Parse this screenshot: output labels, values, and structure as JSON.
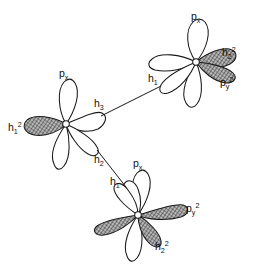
{
  "figure": {
    "background_color": "#ffffff",
    "line_color": "#1a1a1a",
    "shaded_lobe_fill": "#8c8c8c"
  },
  "atoms": [
    {
      "id": "atom-top-right",
      "name": "top-right-atom",
      "center": {
        "x": 196,
        "y": 62
      },
      "labels": [
        {
          "key": "px",
          "base": "p",
          "sub": "x",
          "sup": "",
          "text": "px",
          "x": 194,
          "y": 16
        },
        {
          "key": "h2sq",
          "base": "h",
          "sub": "2",
          "sup": "2",
          "text": "h2 2",
          "x": 224,
          "y": 53
        },
        {
          "key": "pysq",
          "base": "p",
          "sub": "y",
          "sup": "2",
          "text": "py 2",
          "x": 222,
          "y": 83
        },
        {
          "key": "h1",
          "base": "h",
          "sub": "1",
          "sup": "",
          "text": "h1",
          "x": 152,
          "y": 79
        }
      ]
    },
    {
      "id": "atom-left",
      "name": "left-atom",
      "center": {
        "x": 66,
        "y": 124
      },
      "labels": [
        {
          "key": "px",
          "base": "p",
          "sub": "x",
          "sup": "",
          "text": "px",
          "x": 61,
          "y": 73
        },
        {
          "key": "h3",
          "base": "h",
          "sub": "3",
          "sup": "",
          "text": "h3",
          "x": 96,
          "y": 104
        },
        {
          "key": "h1sq",
          "base": "h",
          "sub": "1",
          "sup": "2",
          "text": "h1 2",
          "x": 11,
          "y": 128
        },
        {
          "key": "h2",
          "base": "h",
          "sub": "2",
          "sup": "",
          "text": "h2",
          "x": 96,
          "y": 160
        }
      ]
    },
    {
      "id": "atom-bottom",
      "name": "bottom-atom",
      "center": {
        "x": 138,
        "y": 215
      },
      "labels": [
        {
          "key": "px",
          "base": "p",
          "sub": "x",
          "sup": "",
          "text": "px",
          "x": 135,
          "y": 163
        },
        {
          "key": "h1",
          "base": "h",
          "sub": "1",
          "sup": "",
          "text": "h1",
          "x": 113,
          "y": 182
        },
        {
          "key": "pysq",
          "base": "p",
          "sub": "y",
          "sup": "2",
          "text": "py 2",
          "x": 188,
          "y": 209
        },
        {
          "key": "h2sq",
          "base": "h",
          "sub": "2",
          "sup": "2",
          "text": "h2 2",
          "x": 157,
          "y": 247
        }
      ]
    }
  ],
  "bonds": [
    {
      "id": "bond-h3-h1",
      "name": "bond-left-to-topright",
      "from": "h3",
      "to": "h1",
      "x1": 101,
      "y1": 116,
      "x2": 159,
      "y2": 88
    },
    {
      "id": "bond-h2-h1",
      "name": "bond-left-to-bottom",
      "from": "h2",
      "to": "h1",
      "x1": 97,
      "y1": 150,
      "x2": 125,
      "y2": 186
    }
  ]
}
